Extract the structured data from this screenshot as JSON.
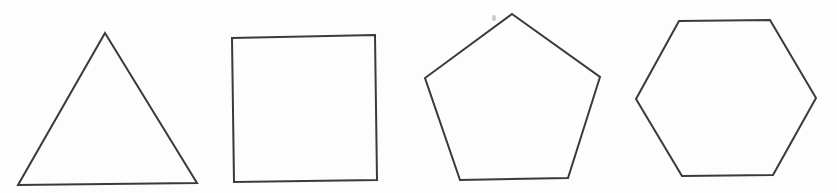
{
  "figure": {
    "stroke_color": "#3a3a3a",
    "background": "#fdfdfd",
    "shapes": [
      {
        "name": "triangle",
        "sides": 3,
        "points": "105,33 197,183 18,185"
      },
      {
        "name": "square",
        "sides": 4,
        "points": "232,38 375,35 377,180 234,182"
      },
      {
        "name": "pentagon",
        "sides": 5,
        "points": "512,14 600,77 568,178 460,180 425,78"
      },
      {
        "name": "hexagon",
        "sides": 6,
        "points": "679,21 770,20 816,98 773,175 682,176 636,99"
      }
    ]
  }
}
